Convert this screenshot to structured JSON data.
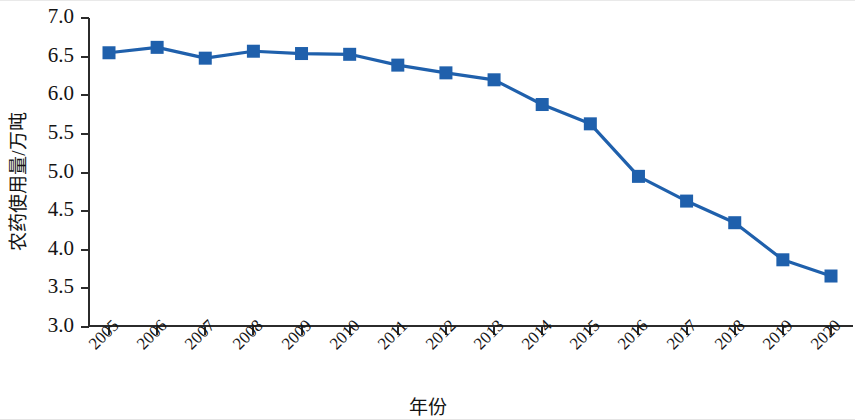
{
  "chart_data": {
    "type": "line",
    "title": "",
    "xlabel": "年份",
    "ylabel": "农药使用量/万吨",
    "categories": [
      "2005",
      "2006",
      "2007",
      "2008",
      "2009",
      "2010",
      "2011",
      "2012",
      "2013",
      "2014",
      "2015",
      "2016",
      "2017",
      "2018",
      "2019",
      "2020"
    ],
    "values": [
      6.55,
      6.62,
      6.48,
      6.57,
      6.54,
      6.53,
      6.39,
      6.29,
      6.2,
      5.88,
      5.63,
      4.95,
      4.63,
      4.35,
      3.87,
      3.66
    ],
    "series": [
      {
        "name": "农药使用量",
        "values": [
          6.55,
          6.62,
          6.48,
          6.57,
          6.54,
          6.53,
          6.39,
          6.29,
          6.2,
          5.88,
          5.63,
          4.95,
          4.63,
          4.35,
          3.87,
          3.66
        ]
      }
    ],
    "ylim": [
      3.0,
      7.0
    ],
    "ytick_labels": [
      "3.0",
      "3.5",
      "4.0",
      "4.5",
      "5.0",
      "5.5",
      "6.0",
      "6.5",
      "7.0"
    ],
    "ytick_values": [
      3.0,
      3.5,
      4.0,
      4.5,
      5.0,
      5.5,
      6.0,
      6.5,
      7.0
    ],
    "xtick_labels": [
      "2005",
      "2006",
      "2007",
      "2008",
      "2009",
      "2010",
      "2011",
      "2012",
      "2013",
      "2014",
      "2015",
      "2016",
      "2017",
      "2018",
      "2019",
      "2020"
    ],
    "grid": false,
    "legend": "none",
    "marker": "square",
    "marker_color": "#1f60ac",
    "line_color": "#1f60ac",
    "axis_color": "#2b2b2b",
    "background": "#ffffff"
  }
}
